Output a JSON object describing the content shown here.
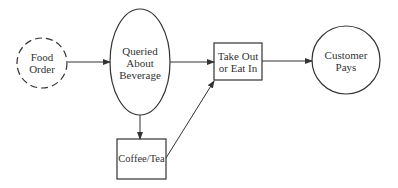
{
  "diagram": {
    "nodes": [
      {
        "id": "food-order",
        "shape": "dashed-circle",
        "label_lines": [
          "Food",
          "Order"
        ]
      },
      {
        "id": "queried-about-beverage",
        "shape": "ellipse",
        "label_lines": [
          "Queried",
          "About",
          "Beverage"
        ]
      },
      {
        "id": "take-out-or-eat-in",
        "shape": "rectangle",
        "label_lines": [
          "Take Out",
          "or Eat In"
        ]
      },
      {
        "id": "customer-pays",
        "shape": "circle",
        "label_lines": [
          "Customer",
          "Pays"
        ]
      },
      {
        "id": "coffee-tea",
        "shape": "rectangle",
        "label_lines": [
          "Coffee/Tea"
        ]
      }
    ],
    "edges": [
      {
        "from": "food-order",
        "to": "queried-about-beverage"
      },
      {
        "from": "queried-about-beverage",
        "to": "take-out-or-eat-in"
      },
      {
        "from": "queried-about-beverage",
        "to": "coffee-tea"
      },
      {
        "from": "coffee-tea",
        "to": "take-out-or-eat-in"
      },
      {
        "from": "take-out-or-eat-in",
        "to": "customer-pays"
      }
    ],
    "colors": {
      "stroke": "#333333",
      "text": "#333333",
      "background": "#ffffff"
    }
  }
}
